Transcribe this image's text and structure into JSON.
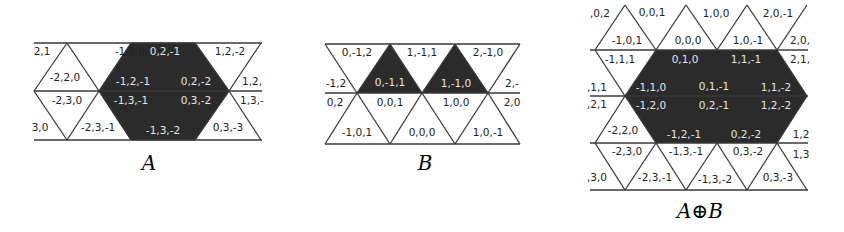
{
  "colors": {
    "filled": "#2b2b2b",
    "line": "#3a3a3a",
    "text_dark": "#222222",
    "text_light": "#e6e6e6"
  },
  "figures": [
    {
      "id": "A",
      "caption": "A",
      "cells": [
        {
          "label": "2,1",
          "x": 42,
          "y": 52,
          "filled": false
        },
        {
          "label": "-1,2,0",
          "x": 130,
          "y": 52,
          "filled": false
        },
        {
          "label": "0,2,-1",
          "x": 165,
          "y": 52,
          "filled": true
        },
        {
          "label": "1,2,-2",
          "x": 230,
          "y": 52,
          "filled": false
        },
        {
          "label": "-2,2,0",
          "x": 65,
          "y": 78,
          "filled": false
        },
        {
          "label": "-1,2,-1",
          "x": 133,
          "y": 82,
          "filled": true
        },
        {
          "label": "0,2,-2",
          "x": 196,
          "y": 82,
          "filled": true
        },
        {
          "label": "1,2,",
          "x": 252,
          "y": 82,
          "filled": false
        },
        {
          "label": "-2,3,0",
          "x": 67,
          "y": 101,
          "filled": false
        },
        {
          "label": "-1,3,-1",
          "x": 131,
          "y": 101,
          "filled": true
        },
        {
          "label": "0,3,-2",
          "x": 196,
          "y": 101,
          "filled": true
        },
        {
          "label": "1,3,-",
          "x": 252,
          "y": 101,
          "filled": false
        },
        {
          "label": "3,0",
          "x": 40,
          "y": 128,
          "filled": false
        },
        {
          "label": "-2,3,-1",
          "x": 98,
          "y": 128,
          "filled": false
        },
        {
          "label": "-1,3,-2",
          "x": 163,
          "y": 131,
          "filled": true
        },
        {
          "label": "0,3,-3",
          "x": 228,
          "y": 128,
          "filled": false
        }
      ]
    },
    {
      "id": "B",
      "caption": "B",
      "cells": [
        {
          "label": "0,-1,2",
          "x": 357,
          "y": 53,
          "filled": false
        },
        {
          "label": "1,-1,1",
          "x": 422,
          "y": 53,
          "filled": false
        },
        {
          "label": "2,-1,0",
          "x": 488,
          "y": 53,
          "filled": false
        },
        {
          "label": "-1,2",
          "x": 336,
          "y": 84,
          "filled": false
        },
        {
          "label": "0,-1,1",
          "x": 390,
          "y": 83,
          "filled": true
        },
        {
          "label": "1,-1,0",
          "x": 456,
          "y": 84,
          "filled": true
        },
        {
          "label": "2,-",
          "x": 512,
          "y": 84,
          "filled": false
        },
        {
          "label": "0,2",
          "x": 335,
          "y": 103,
          "filled": false
        },
        {
          "label": "0,0,1",
          "x": 390,
          "y": 103,
          "filled": false
        },
        {
          "label": "1,0,0",
          "x": 456,
          "y": 103,
          "filled": false
        },
        {
          "label": "2,0",
          "x": 512,
          "y": 103,
          "filled": false
        },
        {
          "label": "-1,0,1",
          "x": 357,
          "y": 133,
          "filled": false
        },
        {
          "label": "0,0,0",
          "x": 422,
          "y": 133,
          "filled": false
        },
        {
          "label": "1,0,-1",
          "x": 488,
          "y": 133,
          "filled": false
        }
      ]
    },
    {
      "id": "AB",
      "caption": "A⊕B",
      "cells": [
        {
          "label": ",0,2",
          "x": 600,
          "y": 14,
          "filled": false
        },
        {
          "label": "0,0,1",
          "x": 652,
          "y": 13,
          "filled": false
        },
        {
          "label": "1,0,0",
          "x": 716,
          "y": 14,
          "filled": false
        },
        {
          "label": "2,0,-1",
          "x": 778,
          "y": 14,
          "filled": false
        },
        {
          "label": "-1,0,1",
          "x": 627,
          "y": 41,
          "filled": false
        },
        {
          "label": "0,0,0",
          "x": 688,
          "y": 41,
          "filled": false
        },
        {
          "label": "1,0,-1",
          "x": 748,
          "y": 41,
          "filled": false
        },
        {
          "label": "2,0,",
          "x": 800,
          "y": 41,
          "filled": false
        },
        {
          "label": "-1,1,1",
          "x": 620,
          "y": 60,
          "filled": false
        },
        {
          "label": "0,1,0",
          "x": 685,
          "y": 60,
          "filled": true
        },
        {
          "label": "1,1,-1",
          "x": 746,
          "y": 60,
          "filled": true
        },
        {
          "label": "2,1,",
          "x": 800,
          "y": 60,
          "filled": false
        },
        {
          "label": ",1,1",
          "x": 597,
          "y": 88,
          "filled": false
        },
        {
          "label": "-1,1,0",
          "x": 651,
          "y": 88,
          "filled": true
        },
        {
          "label": "0,1,-1",
          "x": 714,
          "y": 87,
          "filled": true
        },
        {
          "label": "1,1,-2",
          "x": 776,
          "y": 88,
          "filled": true
        },
        {
          "label": ",2,1",
          "x": 597,
          "y": 105,
          "filled": false
        },
        {
          "label": "-1,2,0",
          "x": 651,
          "y": 106,
          "filled": true
        },
        {
          "label": "0,2,-1",
          "x": 714,
          "y": 106,
          "filled": true
        },
        {
          "label": "1,2,-2",
          "x": 776,
          "y": 106,
          "filled": true
        },
        {
          "label": "-2,2,0",
          "x": 623,
          "y": 131,
          "filled": false
        },
        {
          "label": "-1,2,-1",
          "x": 684,
          "y": 135,
          "filled": true
        },
        {
          "label": "0,2,-2",
          "x": 746,
          "y": 135,
          "filled": true
        },
        {
          "label": "1,2",
          "x": 801,
          "y": 135,
          "filled": false
        },
        {
          "label": "-2,3,0",
          "x": 627,
          "y": 152,
          "filled": false
        },
        {
          "label": "-1,3,-1",
          "x": 686,
          "y": 152,
          "filled": false
        },
        {
          "label": "0,3,-2",
          "x": 748,
          "y": 152,
          "filled": false
        },
        {
          "label": "1,3",
          "x": 801,
          "y": 155,
          "filled": false
        },
        {
          "label": ",3,0",
          "x": 597,
          "y": 178,
          "filled": false
        },
        {
          "label": "-2,3,-1",
          "x": 655,
          "y": 178,
          "filled": false
        },
        {
          "label": "-1,3,-2",
          "x": 715,
          "y": 180,
          "filled": false
        },
        {
          "label": "0,3,-3",
          "x": 778,
          "y": 178,
          "filled": false
        }
      ]
    }
  ],
  "captions": {
    "A": "A",
    "B": "B",
    "AB": "A⊕B"
  }
}
